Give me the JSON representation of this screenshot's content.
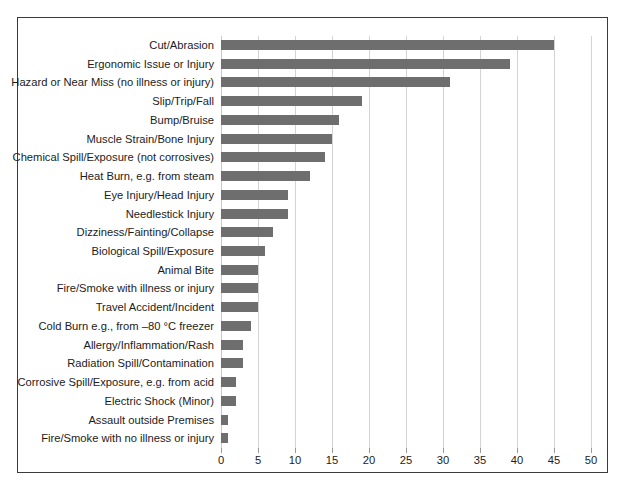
{
  "chart_data": {
    "type": "bar",
    "orientation": "horizontal",
    "title": "",
    "subtitle": "",
    "xlabel": "",
    "ylabel": "",
    "xlim": [
      0,
      50
    ],
    "xticks": [
      "0",
      "5",
      "10",
      "15",
      "20",
      "25",
      "30",
      "35",
      "40",
      "45",
      "50"
    ],
    "xtick_values": [
      0,
      5,
      10,
      15,
      20,
      25,
      30,
      35,
      40,
      45,
      50
    ],
    "grid": "vertical",
    "legend": "none",
    "bar_color": "#6e6e6e",
    "grid_color": "#d3d3d3",
    "frame_color": "#3a3a3a",
    "background_color": "#ffffff",
    "categories": [
      "Cut/Abrasion",
      "Ergonomic Issue or Injury",
      "Hazard or Near Miss (no illness or injury)",
      "Slip/Trip/Fall",
      "Bump/Bruise",
      "Muscle Strain/Bone Injury",
      "Chemical Spill/Exposure (not corrosives)",
      "Heat Burn, e.g. from steam",
      "Eye Injury/Head Injury",
      "Needlestick Injury",
      "Dizziness/Fainting/Collapse",
      "Biological Spill/Exposure",
      "Animal Bite",
      "Fire/Smoke with illness or injury",
      "Travel Accident/Incident",
      "Cold Burn e.g., from –80 °C freezer",
      "Allergy/Inflammation/Rash",
      "Radiation Spill/Contamination",
      "Corrosive Spill/Exposure, e.g. from acid",
      "Electric Shock (Minor)",
      "Assault outside Premises",
      "Fire/Smoke with no illness or injury"
    ],
    "values": [
      45,
      39,
      31,
      19,
      16,
      15,
      14,
      12,
      9,
      9,
      7,
      6,
      5,
      5,
      5,
      4,
      3,
      3,
      2,
      2,
      1,
      1
    ]
  }
}
